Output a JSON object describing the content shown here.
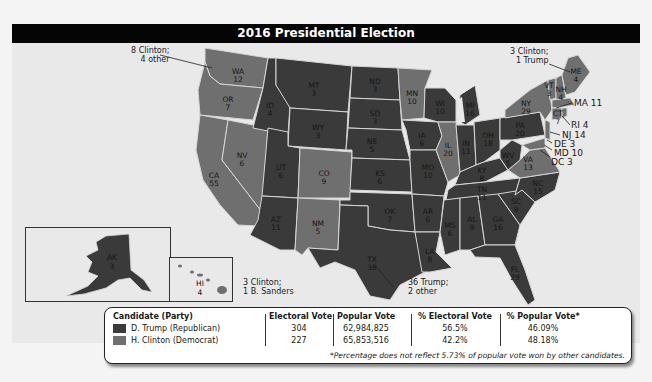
{
  "title": "2016 Presidential Election",
  "colors": {
    "republican": "#3a3a3a",
    "democrat": "#6f6f6f",
    "background": "#e9e9e9",
    "header": "#050505"
  },
  "states": [
    {
      "abbr": "WA",
      "ev": "12",
      "party": "D"
    },
    {
      "abbr": "OR",
      "ev": "7",
      "party": "D"
    },
    {
      "abbr": "CA",
      "ev": "55",
      "party": "D"
    },
    {
      "abbr": "NV",
      "ev": "6",
      "party": "D"
    },
    {
      "abbr": "ID",
      "ev": "4",
      "party": "R"
    },
    {
      "abbr": "MT",
      "ev": "3",
      "party": "R"
    },
    {
      "abbr": "WY",
      "ev": "3",
      "party": "R"
    },
    {
      "abbr": "UT",
      "ev": "6",
      "party": "R"
    },
    {
      "abbr": "AZ",
      "ev": "11",
      "party": "R"
    },
    {
      "abbr": "CO",
      "ev": "9",
      "party": "D"
    },
    {
      "abbr": "NM",
      "ev": "5",
      "party": "D"
    },
    {
      "abbr": "ND",
      "ev": "3",
      "party": "R"
    },
    {
      "abbr": "SD",
      "ev": "3",
      "party": "R"
    },
    {
      "abbr": "NE",
      "ev": "5",
      "party": "R"
    },
    {
      "abbr": "KS",
      "ev": "6",
      "party": "R"
    },
    {
      "abbr": "OK",
      "ev": "7",
      "party": "R"
    },
    {
      "abbr": "TX",
      "ev": "38",
      "party": "R"
    },
    {
      "abbr": "MN",
      "ev": "10",
      "party": "D"
    },
    {
      "abbr": "IA",
      "ev": "6",
      "party": "R"
    },
    {
      "abbr": "MO",
      "ev": "10",
      "party": "R"
    },
    {
      "abbr": "AR",
      "ev": "6",
      "party": "R"
    },
    {
      "abbr": "LA",
      "ev": "8",
      "party": "R"
    },
    {
      "abbr": "WI",
      "ev": "10",
      "party": "R"
    },
    {
      "abbr": "IL",
      "ev": "20",
      "party": "D"
    },
    {
      "abbr": "MI",
      "ev": "16",
      "party": "R"
    },
    {
      "abbr": "IN",
      "ev": "11",
      "party": "R"
    },
    {
      "abbr": "OH",
      "ev": "18",
      "party": "R"
    },
    {
      "abbr": "KY",
      "ev": "8",
      "party": "R"
    },
    {
      "abbr": "TN",
      "ev": "11",
      "party": "R"
    },
    {
      "abbr": "MS",
      "ev": "6",
      "party": "R"
    },
    {
      "abbr": "AL",
      "ev": "9",
      "party": "R"
    },
    {
      "abbr": "GA",
      "ev": "16",
      "party": "R"
    },
    {
      "abbr": "FL",
      "ev": "29",
      "party": "R"
    },
    {
      "abbr": "SC",
      "ev": "9",
      "party": "R"
    },
    {
      "abbr": "NC",
      "ev": "15",
      "party": "R"
    },
    {
      "abbr": "VA",
      "ev": "13",
      "party": "D"
    },
    {
      "abbr": "WV",
      "ev": "5",
      "party": "R"
    },
    {
      "abbr": "PA",
      "ev": "20",
      "party": "R"
    },
    {
      "abbr": "NY",
      "ev": "29",
      "party": "D"
    },
    {
      "abbr": "VT",
      "ev": "3",
      "party": "D"
    },
    {
      "abbr": "NH",
      "ev": "4",
      "party": "D"
    },
    {
      "abbr": "ME",
      "ev": "4",
      "party": "D"
    },
    {
      "abbr": "MA",
      "ev": "11",
      "party": "D"
    },
    {
      "abbr": "RI",
      "ev": "4",
      "party": "D"
    },
    {
      "abbr": "CT",
      "ev": "7",
      "party": "D"
    },
    {
      "abbr": "NJ",
      "ev": "14",
      "party": "D"
    },
    {
      "abbr": "DE",
      "ev": "3",
      "party": "D"
    },
    {
      "abbr": "MD",
      "ev": "10",
      "party": "D"
    },
    {
      "abbr": "DC",
      "ev": "3",
      "party": "D"
    },
    {
      "abbr": "AK",
      "ev": "3",
      "party": "R"
    },
    {
      "abbr": "HI",
      "ev": "4",
      "party": "D"
    }
  ],
  "external_labels": {
    "ma": "MA 11",
    "ri": "RI 4",
    "nj": "NJ 14",
    "de": "DE 3",
    "md": "MD 10",
    "dc": "DC 3"
  },
  "callouts": {
    "wa": [
      "8 Clinton;",
      "4 other"
    ],
    "me": [
      "3 Clinton;",
      "1 Trump"
    ],
    "hi": [
      "3 Clinton;",
      "1 B. Sanders"
    ],
    "tx": [
      "36 Trump;",
      "2 other"
    ]
  },
  "legend": {
    "headers": {
      "candidate": "Candidate (Party)",
      "electoral": "Electoral Vote",
      "popular": "Popular Vote",
      "pct_electoral": "% Electoral Vote",
      "pct_popular": "% Popular Vote*"
    },
    "rows": [
      {
        "candidate": "D. Trump (Republican)",
        "electoral": "304",
        "popular": "62,984,825",
        "pct_electoral": "56.5%",
        "pct_popular": "46.09%"
      },
      {
        "candidate": "H. Clinton (Democrat)",
        "electoral": "227",
        "popular": "65,853,516",
        "pct_electoral": "42.2%",
        "pct_popular": "48.18%"
      }
    ],
    "footnote": "*Percentage does not reflect 5.73% of popular vote won by other candidates."
  }
}
